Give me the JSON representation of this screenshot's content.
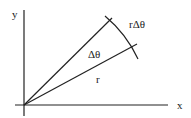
{
  "diagram": {
    "axes": {
      "x_label": "x",
      "y_label": "y"
    },
    "labels": {
      "arc": "rΔθ",
      "angle": "Δθ",
      "radius": "r"
    },
    "colors": {
      "stroke": "#222222",
      "background": "#ffffff"
    }
  }
}
